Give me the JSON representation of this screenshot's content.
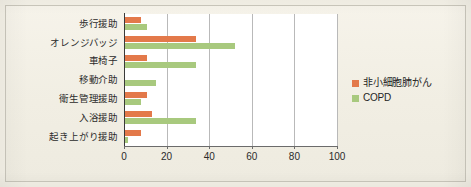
{
  "chart_data": {
    "type": "bar",
    "orientation": "horizontal",
    "title": "",
    "subtitle": "",
    "xlabel": "",
    "ylabel": "",
    "xlim": [
      0,
      100
    ],
    "xticks": [
      0,
      20,
      40,
      60,
      80,
      100
    ],
    "grid": true,
    "grid_axis": "x",
    "legend_position": "right",
    "categories": [
      "歩行援助",
      "オレンジバッジ",
      "車椅子",
      "移動介助",
      "衛生管理援助",
      "入浴援助",
      "起き上がり援助"
    ],
    "series": [
      {
        "name": "非小細胞肺がん",
        "color": "#e3794a",
        "values": [
          8,
          34,
          11,
          0,
          11,
          13,
          8
        ]
      },
      {
        "name": "COPD",
        "color": "#a8c97e",
        "values": [
          11,
          52,
          34,
          15,
          8,
          34,
          2
        ]
      }
    ]
  },
  "axis": {
    "xtick_labels": [
      "0",
      "20",
      "40",
      "60",
      "80",
      "100"
    ]
  },
  "legend": {
    "entries": [
      {
        "label": "非小細胞肺がん",
        "color": "#e3794a",
        "swatch": "orange-swatch"
      },
      {
        "label": "COPD",
        "color": "#a8c97e",
        "swatch": "green-swatch"
      }
    ]
  },
  "colors": {
    "series_orange": "#e3794a",
    "series_green": "#a8c97e",
    "page_background": "#f3f0e6",
    "plot_background": "#ffffff",
    "gridline": "#b9b9b9",
    "axis": "#3a3a3a"
  }
}
